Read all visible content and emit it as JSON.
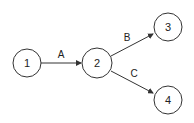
{
  "diagram": {
    "colors": {
      "stroke": "#333333",
      "fill": "#ffffff",
      "text": "#222222"
    },
    "nodes": [
      {
        "id": "1",
        "label": "1",
        "cx": 27,
        "cy": 63,
        "r": 14
      },
      {
        "id": "2",
        "label": "2",
        "cx": 97,
        "cy": 63,
        "r": 15
      },
      {
        "id": "3",
        "label": "3",
        "cx": 168,
        "cy": 27,
        "r": 14
      },
      {
        "id": "4",
        "label": "4",
        "cx": 168,
        "cy": 100,
        "r": 14
      }
    ],
    "edges": [
      {
        "from": "1",
        "to": "2",
        "label": "A"
      },
      {
        "from": "2",
        "to": "3",
        "label": "B"
      },
      {
        "from": "2",
        "to": "4",
        "label": "C"
      }
    ]
  }
}
